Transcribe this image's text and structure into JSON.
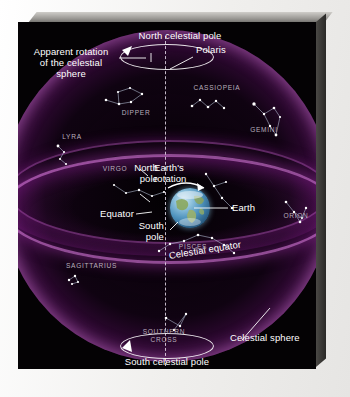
{
  "figure": {
    "type": "astronomy-diagram",
    "subject": "celestial sphere"
  },
  "labels": {
    "apparent_rotation": "Apparent rotation\nof the celestial\nsphere",
    "north_celestial_pole": "North celestial pole",
    "polaris": "Polaris",
    "north_pole": "North\npole",
    "earths_rotation": "Earth's\nrotation",
    "earth": "Earth",
    "equator": "Equator",
    "south_pole": "South\npole",
    "celestial_equator": "Celestial equator",
    "celestial_sphere": "Celestial sphere",
    "south_celestial_pole": "South celestial pole"
  },
  "constellations": [
    {
      "name": "DIPPER",
      "display": "DIPPER"
    },
    {
      "name": "CASSIOPEIA",
      "display": "CASSIOPEIA"
    },
    {
      "name": "LYRA",
      "display": "LYRA"
    },
    {
      "name": "GEMINI",
      "display": "GEMINI"
    },
    {
      "name": "VIRGO",
      "display": "VIRGO"
    },
    {
      "name": "ORION",
      "display": "ORION"
    },
    {
      "name": "PISCES",
      "display": "PISCES"
    },
    {
      "name": "SAGITTARIUS",
      "display": "SAGITTARIUS"
    },
    {
      "name": "SOUTHERN CROSS",
      "display": "SOUTHERN\nCROSS"
    }
  ],
  "colors": {
    "background": "#040204",
    "sphere_glow": "#9628a0",
    "sphere_rim": "#ce78d2",
    "label_text": "#ffffff",
    "constellation_text": "#b9aebd",
    "earth_ocean": "#4f93bd",
    "earth_land": "#8aa861",
    "axis_line": "#ebe1f0",
    "frame": "#6d6b68",
    "paper": "#f4f3f1"
  }
}
